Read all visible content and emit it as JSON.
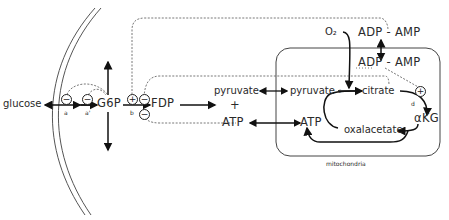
{
  "diagram": {
    "nodes": {
      "glucose": "glucose",
      "g6p": "G6P",
      "fdp": "FDP",
      "pyruvate_cyto": "pyruvate",
      "plus": "+",
      "atp_cyto": "ATP",
      "o2": "O₂",
      "adp_amp_outer": "ADP - AMP",
      "adp_amp_inner": "ADP - AMP",
      "pyruvate_mito": "pyruvate",
      "citrate": "citrate",
      "akg": "αKG",
      "oxalacetate": "oxalacetate",
      "atp_mito": "ATP"
    },
    "enzyme_labels": {
      "a": "a",
      "a_prime": "a'",
      "b": "b",
      "c": "c",
      "d": "d"
    },
    "regulation_signs": {
      "minus": "−",
      "plus": "+"
    },
    "compartment_label": "mitochondria"
  }
}
